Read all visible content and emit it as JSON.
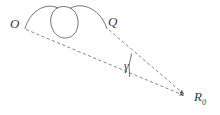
{
  "figure": {
    "type": "geometric-diagram",
    "background_color": "#ffffff",
    "stroke_color": "#5a5a5a",
    "label_color": "#3a3a3a",
    "labels": {
      "origin": "O",
      "point_q": "Q",
      "angle": "γ",
      "radius_base": "R",
      "radius_subscript": "0"
    },
    "geometry": {
      "point_o": [
        25,
        28
      ],
      "point_q": [
        107,
        28
      ],
      "apex": [
        187,
        97
      ],
      "loop_center": [
        64,
        23
      ],
      "loop_radius": 14,
      "angle_arc_radius": 46,
      "angle_degrees": 10
    }
  }
}
